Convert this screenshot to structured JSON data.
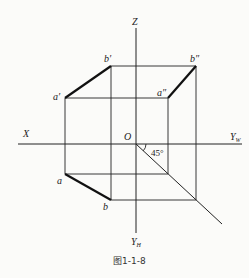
{
  "diagram": {
    "type": "orthographic-projection",
    "axes": {
      "z_label": "Z",
      "x_label": "X",
      "yw_label": "Y",
      "yw_sub": "W",
      "yh_label": "Y",
      "yh_sub": "H",
      "origin_label": "O"
    },
    "angle_label": "45°",
    "points": {
      "a_front": "a′",
      "b_front": "b′",
      "a_side": "a″",
      "b_side": "b″",
      "a_top": "a",
      "b_top": "b"
    },
    "caption": "图1-1-8"
  }
}
